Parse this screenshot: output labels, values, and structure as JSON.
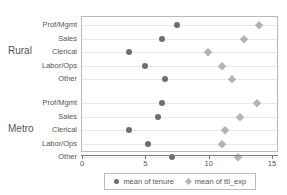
{
  "chart_data": {
    "type": "scatter",
    "title": "",
    "xlabel": "",
    "ylabel": "",
    "xlim": [
      0,
      15
    ],
    "xticks": [
      0,
      5,
      10,
      15
    ],
    "xtick_labels": [
      "0",
      "5",
      "10",
      "15"
    ],
    "grid": true,
    "legend_position": "bottom",
    "groups": [
      {
        "name": "Rural",
        "categories": [
          "Prof/Mgmt",
          "Sales",
          "Clerical",
          "Labor/Ops",
          "Other"
        ],
        "series": [
          {
            "name": "mean of tenure",
            "values": [
              7.4,
              6.2,
              3.6,
              4.9,
              6.5
            ]
          },
          {
            "name": "mean of ttl_exp",
            "values": [
              13.9,
              12.7,
              9.9,
              11.0,
              11.8
            ]
          }
        ]
      },
      {
        "name": "Metro",
        "categories": [
          "Prof/Mgmt",
          "Sales",
          "Clerical",
          "Labor/Ops",
          "Other"
        ],
        "series": [
          {
            "name": "mean of tenure",
            "values": [
              6.2,
              5.9,
              3.6,
              5.1,
              7.0
            ]
          },
          {
            "name": "mean of ttl_exp",
            "values": [
              13.7,
              12.4,
              11.2,
              11.0,
              12.2
            ]
          }
        ]
      }
    ],
    "series_styles": [
      {
        "name": "mean of tenure",
        "marker": "circle",
        "color": "#6e6e6e"
      },
      {
        "name": "mean of ttl_exp",
        "marker": "diamond",
        "color": "#b3b3b3"
      }
    ]
  },
  "legend": {
    "items": [
      {
        "label": "mean of tenure",
        "marker": "circle-marker-icon"
      },
      {
        "label": "mean of ttl_exp",
        "marker": "diamond-marker-icon"
      }
    ]
  }
}
